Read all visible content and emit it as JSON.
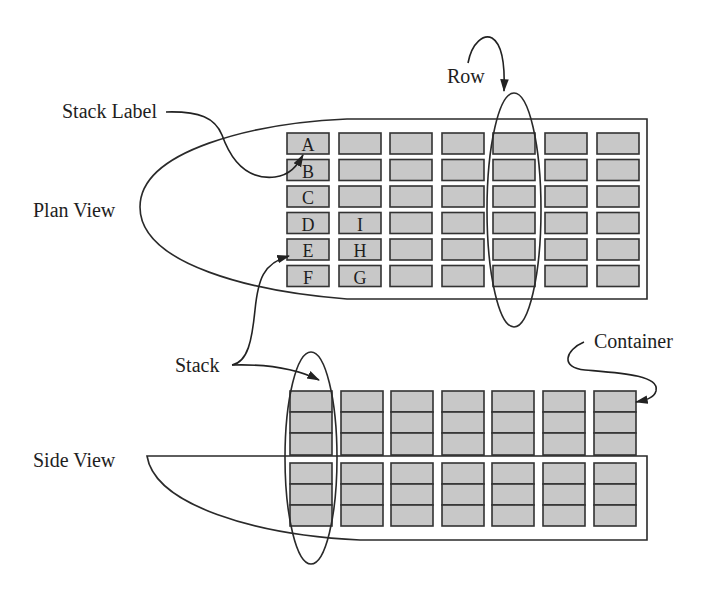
{
  "colors": {
    "container_fill": "#c8c8c8",
    "outline": "#333333",
    "background": "#ffffff"
  },
  "annotations": {
    "stack_label": "Stack Label",
    "row": "Row",
    "stack": "Stack",
    "container": "Container"
  },
  "plan_view": {
    "title": "Plan View",
    "grid": {
      "columns": 7,
      "rows": 6
    },
    "stack_labels": [
      {
        "label": "A",
        "column": 1,
        "row": 1
      },
      {
        "label": "B",
        "column": 1,
        "row": 2
      },
      {
        "label": "C",
        "column": 1,
        "row": 3
      },
      {
        "label": "D",
        "column": 1,
        "row": 4
      },
      {
        "label": "E",
        "column": 1,
        "row": 5
      },
      {
        "label": "F",
        "column": 1,
        "row": 6
      },
      {
        "label": "I",
        "column": 2,
        "row": 4
      },
      {
        "label": "H",
        "column": 2,
        "row": 5
      },
      {
        "label": "G",
        "column": 2,
        "row": 6
      }
    ],
    "highlighted_row_column": 5
  },
  "side_view": {
    "title": "Side View",
    "grid": {
      "columns": 7,
      "tiers_above_deck": 3,
      "tiers_below_deck": 3
    },
    "highlighted_stack_column": 1
  }
}
